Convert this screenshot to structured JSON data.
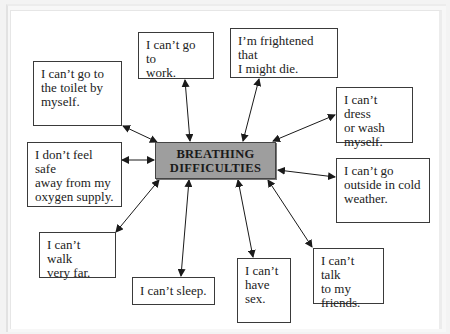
{
  "diagram": {
    "center": {
      "label": "BREATHING\nDIFFICULTIES",
      "fill": "#9e9e9e"
    },
    "nodes": [
      {
        "id": "toilet",
        "label": "I can’t go to\nthe toilet by\nmyself."
      },
      {
        "id": "work",
        "label": "I can’t go to\nwork."
      },
      {
        "id": "frightened",
        "label": "I’m frightened that\nI might die."
      },
      {
        "id": "dress",
        "label": "I can’t dress\nor wash\nmyself."
      },
      {
        "id": "safe",
        "label": "I don’t feel safe\naway from my\noxygen supply."
      },
      {
        "id": "outside",
        "label": "I can’t go\noutside in cold\nweather."
      },
      {
        "id": "walk",
        "label": "I can’t walk\nvery far."
      },
      {
        "id": "sleep",
        "label": "I can’t sleep."
      },
      {
        "id": "sex",
        "label": "I can’t\nhave\nsex."
      },
      {
        "id": "talk",
        "label": "I can’t talk\nto my\nfriends."
      }
    ],
    "connector": "double-headed-arrow",
    "arrow_color": "#1a1a1a"
  }
}
